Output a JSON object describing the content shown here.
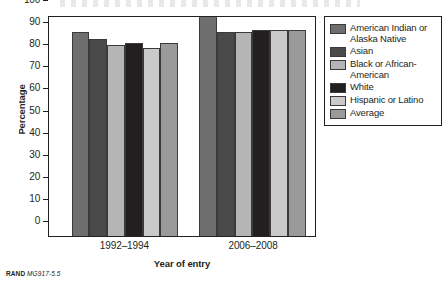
{
  "figure": {
    "footer_brand": "RAND",
    "footer_code": "MG917-5.5"
  },
  "chart_data": {
    "type": "bar",
    "title": "",
    "xlabel": "Year of entry",
    "ylabel": "Percentage",
    "categories": [
      "1992–1994",
      "2006–2008"
    ],
    "ylim": [
      0,
      100
    ],
    "yticks": [
      "0",
      "10",
      "20",
      "30",
      "40",
      "50",
      "60",
      "70",
      "80",
      "90",
      "100"
    ],
    "grid": false,
    "legend_position": "right",
    "series": [
      {
        "name": "American Indian or Alaska Native",
        "color": "#6e6e6e",
        "values": [
          93,
          100
        ]
      },
      {
        "name": "Asian",
        "color": "#4a4a4a",
        "values": [
          90,
          93
        ]
      },
      {
        "name": "Black or African-American",
        "color": "#b5b5b5",
        "values": [
          87,
          93
        ]
      },
      {
        "name": "White",
        "color": "#231f20",
        "values": [
          88,
          94
        ]
      },
      {
        "name": "Hispanic or Latino",
        "color": "#cacaca",
        "values": [
          86,
          94
        ]
      },
      {
        "name": "Average",
        "color": "#9a9a9a",
        "values": [
          88,
          94
        ]
      }
    ]
  }
}
